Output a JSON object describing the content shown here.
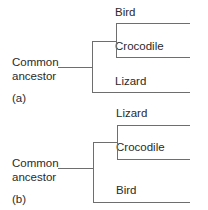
{
  "diagrams": [
    {
      "id": "a",
      "panel_label": "(a)",
      "root_label_line1": "Common",
      "root_label_line2": "ancestor",
      "tips": [
        "Bird",
        "Crocodile",
        "Lizard"
      ],
      "topology": "((Bird, Crocodile), Lizard)"
    },
    {
      "id": "b",
      "panel_label": "(b)",
      "root_label_line1": "Common",
      "root_label_line2": "ancestor",
      "tips": [
        "Lizard",
        "Crocodile",
        "Bird"
      ],
      "topology": "((Lizard, Crocodile), Bird)"
    }
  ],
  "colors": {
    "line": "#6e6e6e",
    "text": "#2a2a2a",
    "background": "#ffffff"
  }
}
